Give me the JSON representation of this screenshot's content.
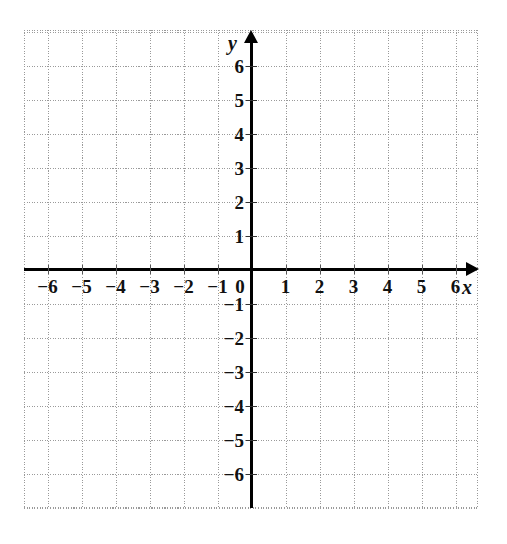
{
  "figure": {
    "type": "coordinate-plane",
    "title": ""
  },
  "axes": {
    "x_name": "x",
    "y_name": "y",
    "origin_label": "0"
  },
  "labels": {
    "x_ticks": [
      "−6",
      "−5",
      "−4",
      "−3",
      "−2",
      "−1",
      "1",
      "2",
      "3",
      "4",
      "5",
      "6"
    ],
    "y_ticks": [
      "6",
      "5",
      "4",
      "3",
      "2",
      "1",
      "−1",
      "−2",
      "−3",
      "−4",
      "−5",
      "−6"
    ]
  },
  "chart_data": {
    "type": "scatter",
    "title": "",
    "xlabel": "x",
    "ylabel": "y",
    "xlim": [
      -6.7,
      6.7
    ],
    "ylim": [
      -7.0,
      7.0
    ],
    "xticks": [
      -6,
      -5,
      -4,
      -3,
      -2,
      -1,
      0,
      1,
      2,
      3,
      4,
      5,
      6
    ],
    "yticks": [
      -6,
      -5,
      -4,
      -3,
      -2,
      -1,
      0,
      1,
      2,
      3,
      4,
      5,
      6
    ],
    "xticklabels": [
      "−6",
      "−5",
      "−4",
      "−3",
      "−2",
      "−1",
      "0",
      "1",
      "2",
      "3",
      "4",
      "5",
      "6"
    ],
    "yticklabels": [
      "−6",
      "−5",
      "−4",
      "−3",
      "−2",
      "−1",
      "0",
      "1",
      "2",
      "3",
      "4",
      "5",
      "6"
    ],
    "grid": true,
    "grid_style": "dotted",
    "grid_color": "#9a9a9a",
    "grid_spacing_units": 1,
    "axis_color": "#000000",
    "background_color": "#ffffff",
    "legend": null,
    "series": [],
    "x": [],
    "y": [],
    "annotations": []
  },
  "colors": {
    "axis": "#000000",
    "grid": "#9a9a9a",
    "text": "#111111",
    "background": "#ffffff"
  }
}
